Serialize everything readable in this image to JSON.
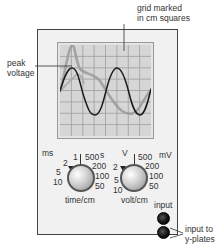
{
  "annotations": {
    "grid": [
      "grid marked",
      "in cm squares"
    ],
    "peak": [
      "peak",
      "voltage"
    ],
    "input_to": [
      "input to",
      "y-plates"
    ]
  },
  "screen": {
    "grid_divisions": 8,
    "traces": [
      {
        "name": "sine wave",
        "color": "#1a1a1a"
      },
      {
        "name": "distorted wave",
        "color": "#9a9a9a"
      }
    ]
  },
  "time_knob": {
    "label": "time/cm",
    "unit_left": "ms",
    "unit_right": "s",
    "scale_left": [
      "1",
      "2",
      "5",
      "10"
    ],
    "scale_right": [
      "500",
      "200",
      "100",
      "50"
    ]
  },
  "volt_knob": {
    "label": "volt/cm",
    "unit_left": "V",
    "unit_right": "mV",
    "scale_left": [
      "2",
      "5",
      "10"
    ],
    "scale_right": [
      "500",
      "200",
      "100",
      "50"
    ]
  },
  "input": {
    "label": "input",
    "sockets": 2
  },
  "colors": {
    "case": "#f1f1f1",
    "screen": "#d6d6d6",
    "grid": "#9d9d9d",
    "trace_main": "#1a1a1a",
    "trace_secondary": "#9a9a9a"
  }
}
